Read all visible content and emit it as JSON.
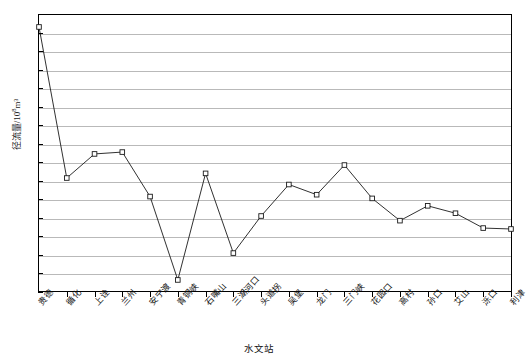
{
  "chart_data": {
    "type": "line",
    "title": "",
    "xlabel": "水文站",
    "ylabel": "径流量/10⁸m³",
    "ylim": [
      -100,
      200
    ],
    "ytick_step": 20,
    "yticks": [
      200,
      180,
      160,
      140,
      120,
      100,
      80,
      60,
      40,
      20,
      0,
      -20,
      -40,
      -60,
      -80,
      -100
    ],
    "ytick_labels": [
      "200",
      "180",
      "160",
      "140",
      "120",
      "100",
      "80",
      "60",
      "40",
      "20",
      "0",
      "-20",
      "-40",
      "-60",
      "-80",
      "-100"
    ],
    "grid": true,
    "legend": "none",
    "categories": [
      "贵德",
      "循化",
      "上诠",
      "兰州",
      "安宁渡",
      "青铜峡",
      "石嘴山",
      "三湖河口",
      "头道拐",
      "吴堡",
      "龙门",
      "三门峡",
      "花园口",
      "高村",
      "孙口",
      "艾山",
      "泺口",
      "利津"
    ],
    "values": [
      186,
      23,
      49,
      51,
      3,
      -87,
      28,
      -58,
      -18,
      16,
      5,
      37,
      1,
      -23,
      -7,
      -15,
      -31,
      -32
    ],
    "marker": "open-square",
    "line_color": "#1a1a1a",
    "marker_fill": "#ffffff",
    "grid_color": "#b9b9b9",
    "axis_color": "#000000"
  },
  "axis": {
    "y_title_main": "径流量/10",
    "y_title_exp": "8",
    "y_title_tail": "m³"
  }
}
